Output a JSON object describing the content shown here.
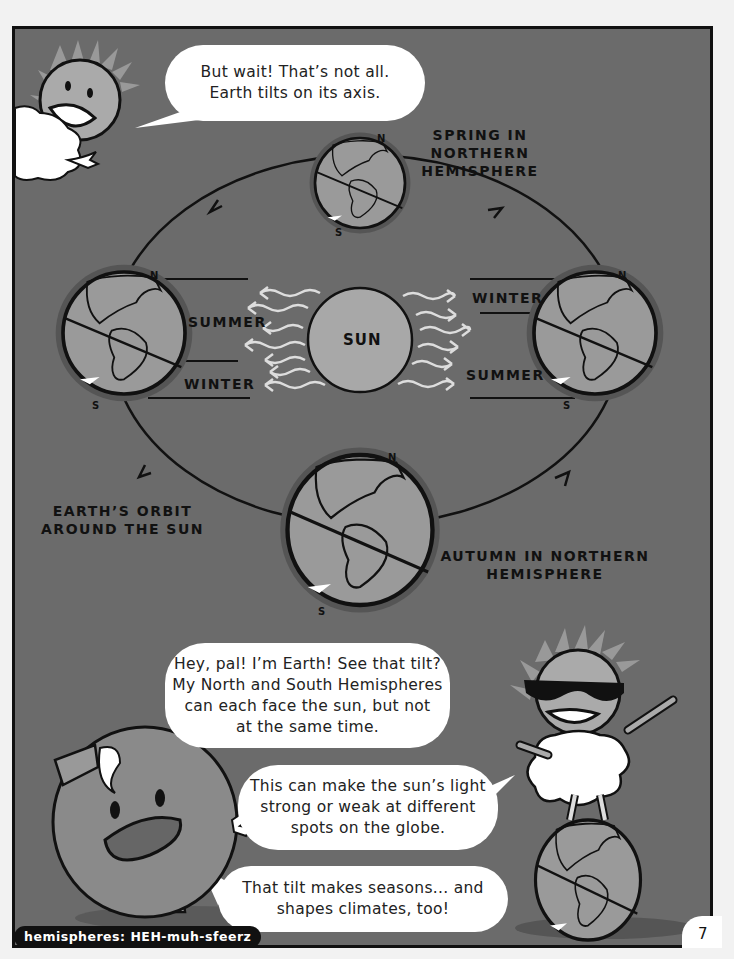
{
  "page": {
    "number": "7",
    "background_color": "#6b6b6b",
    "pronunciation": "hemispheres: HEH-muh-sfeerz"
  },
  "bubbles": {
    "top_sun": [
      "But wait! That’s not all.",
      "Earth tilts on its axis."
    ],
    "earth_intro": [
      "Hey, pal! I’m Earth! See that tilt?",
      "My North and South Hemispheres",
      "can each face the sun, but not",
      "at the same time."
    ],
    "sun_light": [
      "This can make the sun’s light",
      "strong or weak at different",
      "spots on the globe."
    ],
    "earth_seasons": [
      "That tilt makes seasons... and",
      "shapes climates, too!"
    ]
  },
  "diagram": {
    "sun_label": "SUN",
    "spring_label": [
      "SPRING IN",
      "NORTHERN",
      "HEMISPHERE"
    ],
    "autumn_label": [
      "AUTUMN IN NORTHERN",
      "HEMISPHERE"
    ],
    "orbit_label": [
      "EARTH’S ORBIT",
      "AROUND THE SUN"
    ],
    "left_earth": {
      "top_label": "SUMMER",
      "bottom_label": "WINTER",
      "north": "N",
      "south": "S"
    },
    "right_earth": {
      "top_label": "WINTER",
      "bottom_label": "SUMMER",
      "north": "N",
      "south": "S"
    },
    "top_earth": {
      "north": "N",
      "south": "S"
    },
    "bottom_earth": {
      "north": "N",
      "south": "S"
    }
  },
  "characters": [
    {
      "name": "sun-with-cloud",
      "position": "top-left"
    },
    {
      "name": "earth-character",
      "position": "bottom-left"
    },
    {
      "name": "sun-with-sunglasses",
      "position": "bottom-right"
    }
  ]
}
